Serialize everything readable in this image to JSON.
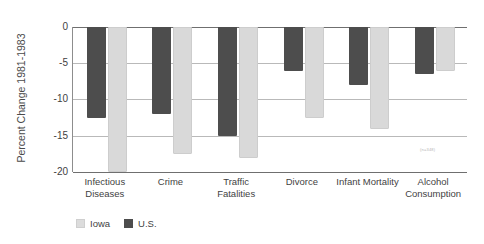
{
  "chart_data": {
    "type": "bar",
    "title": "",
    "subtitle": "",
    "xlabel": "",
    "ylabel": "Percent Change 1981-1983",
    "categories": [
      "Infectious Diseases",
      "Crime",
      "Traffic Fatalities",
      "Divorce",
      "Infant Mortality",
      "Alcohol Consumption"
    ],
    "series": [
      {
        "name": "Iowa",
        "color": "#d9d9d9",
        "values": [
          -20.0,
          -17.5,
          -18.0,
          -12.5,
          -14.0,
          -6.0
        ]
      },
      {
        "name": "U.S.",
        "color": "#4d4d4d",
        "values": [
          -12.5,
          -12.0,
          -15.0,
          -6.0,
          -8.0,
          -6.5
        ]
      }
    ],
    "ylim": [
      -20,
      0
    ],
    "yticks": [
      0,
      -5,
      -10,
      -15,
      -20
    ],
    "ytick_labels": [
      "0",
      "-5",
      "-10",
      "-15",
      "-20"
    ],
    "grid": true,
    "legend_position": "bottom-left",
    "bar_order": [
      "U.S.",
      "Iowa"
    ]
  },
  "legend": {
    "items": [
      {
        "label": "Iowa",
        "swatch": "iowa"
      },
      {
        "label": "U.S.",
        "swatch": "us"
      }
    ]
  },
  "annotations": {
    "source_note": "(n=348)"
  }
}
